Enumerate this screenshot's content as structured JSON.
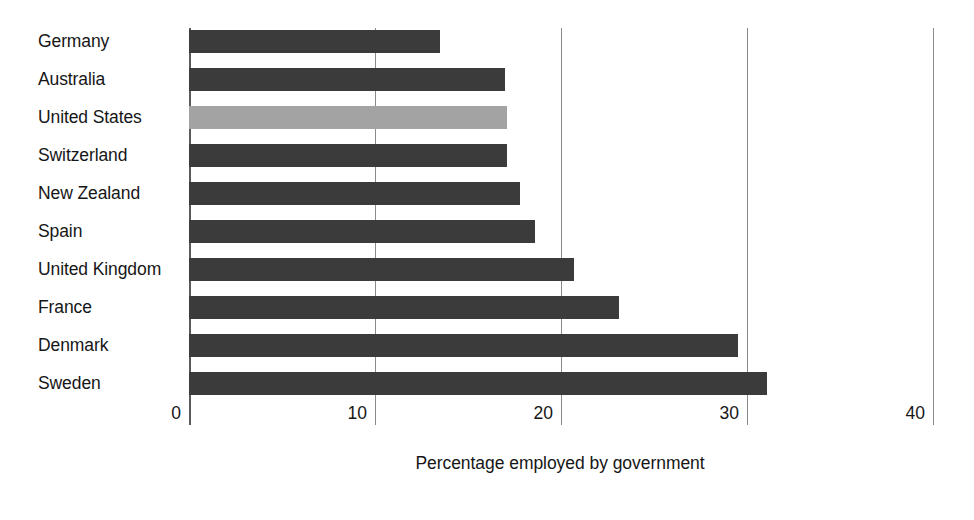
{
  "chart_data": {
    "type": "bar",
    "orientation": "horizontal",
    "title": "",
    "xlabel": "Percentage employed by government",
    "ylabel": "",
    "xlim": [
      0,
      40
    ],
    "xticks": [
      0,
      10,
      20,
      30,
      40
    ],
    "xtick_labels": [
      "0",
      "10",
      "20",
      "30",
      "40"
    ],
    "grid": true,
    "legend": false,
    "categories": [
      "Germany",
      "Australia",
      "United States",
      "Switzerland",
      "New Zealand",
      "Spain",
      "United Kingdom",
      "France",
      "Denmark",
      "Sweden"
    ],
    "values": [
      13.5,
      17.0,
      17.1,
      17.1,
      17.8,
      18.6,
      20.7,
      23.1,
      29.5,
      31.1
    ],
    "highlight_category": "United States",
    "colors": {
      "bar": "#3b3b3b",
      "bar_highlight": "#a3a3a3",
      "gridline": "#8a8a8a",
      "axis": "#5a5a5a",
      "text": "#161616",
      "background": "#ffffff"
    }
  }
}
